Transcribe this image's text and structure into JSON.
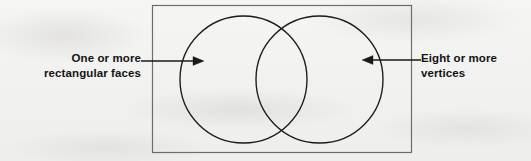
{
  "diagram": {
    "type": "venn-two-set",
    "title": "",
    "universe": {
      "shape": "rectangle",
      "label": "",
      "bounds": {
        "x": 152,
        "y": 5,
        "width": 260,
        "height": 148
      },
      "stroke": "#6d6d6d"
    },
    "sets": [
      {
        "id": "left-set",
        "name": "left-circle",
        "label": "One or more rectangular faces",
        "label_lines": [
          "One or more",
          "rectangular faces"
        ],
        "center": {
          "x": 243.5,
          "y": 79.5
        },
        "radius": 63.5,
        "stroke": "#1a1a1a"
      },
      {
        "id": "right-set",
        "name": "right-circle",
        "label": "Eight or more vertices",
        "label_lines": [
          "Eight or more",
          "vertices"
        ],
        "center": {
          "x": 319.5,
          "y": 79.5
        },
        "radius": 63.5,
        "stroke": "#1a1a1a"
      }
    ],
    "annotations": [
      {
        "id": "left-annotation",
        "text_lines": [
          "One or more",
          "rectangular faces"
        ],
        "arrow": {
          "direction": "right",
          "from": {
            "x": 141,
            "y": 61
          },
          "to": {
            "x": 204,
            "y": 61
          },
          "points_at": "left-set"
        }
      },
      {
        "id": "right-annotation",
        "text_lines": [
          "Eight or more",
          "vertices"
        ],
        "arrow": {
          "direction": "left",
          "from": {
            "x": 421,
            "y": 60
          },
          "to": {
            "x": 362,
            "y": 60
          },
          "points_at": "right-set"
        }
      }
    ],
    "colors": {
      "background": "#f3f3f1",
      "ink": "#141414",
      "circle_stroke": "#1a1a1a",
      "rect_stroke": "#6d6d6d",
      "arrow": "#1a1a1a"
    }
  }
}
